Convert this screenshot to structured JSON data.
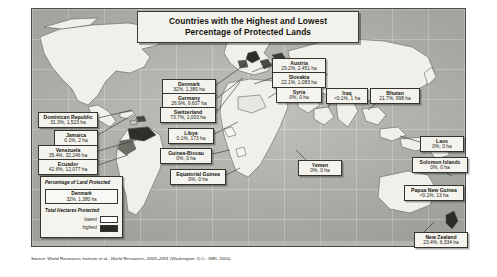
{
  "title": {
    "line1": "Countries with the Highest and Lowest",
    "line2": "Percentage of Protected Lands"
  },
  "source": {
    "prefix": "Source: World Resources Institute et al., ",
    "italic": "World Resources, 2000–2001",
    "suffix": " (Washington, D.C.: WRI, 2000)."
  },
  "legend": {
    "title": "Percentage of Land Protected",
    "sample_name": "Denmark",
    "sample_value": "32%, 1,380 ha",
    "subtitle": "Total Hectares Protected",
    "lowest_label": "lowest",
    "highest_label": "highest",
    "lowest_color": "#ffffff",
    "highest_color": "#2a2a26"
  },
  "callouts": [
    {
      "name": "Dominican Republic",
      "value": "31.3%, 1,523 ha",
      "x": 38,
      "y": 112,
      "w": 60
    },
    {
      "name": "Jamaica",
      "value": "0.1%, 2 ha",
      "x": 54,
      "y": 130,
      "w": 44
    },
    {
      "name": "Venezuela",
      "value": "35.4%, 32,246 ha",
      "x": 38,
      "y": 145,
      "w": 60
    },
    {
      "name": "Ecuador",
      "value": "42.6%, 12,077 ha",
      "x": 38,
      "y": 159,
      "w": 60
    },
    {
      "name": "Denmark",
      "value": "32%, 1,380 ha",
      "x": 162,
      "y": 79,
      "w": 54
    },
    {
      "name": "Germany",
      "value": "26.9%, 9,607 ha",
      "x": 162,
      "y": 93,
      "w": 54
    },
    {
      "name": "Switzerland",
      "value": "73.7%, 1,003 ha",
      "x": 160,
      "y": 107,
      "w": 56
    },
    {
      "name": "Libya",
      "value": "0.1%, 173 ha",
      "x": 168,
      "y": 128,
      "w": 46
    },
    {
      "name": "Guinea-Bissau",
      "value": "0%, 0 ha",
      "x": 160,
      "y": 148,
      "w": 52
    },
    {
      "name": "Equatorial Guinea",
      "value": "0%, 0 ha",
      "x": 170,
      "y": 169,
      "w": 56
    },
    {
      "name": "Austria",
      "value": "29.2%, 2,451 ha",
      "x": 272,
      "y": 58,
      "w": 54
    },
    {
      "name": "Slovakia",
      "value": "22.1%, 1,083 ha",
      "x": 272,
      "y": 72,
      "w": 54
    },
    {
      "name": "Syria",
      "value": "0%, 0 ha",
      "x": 276,
      "y": 87,
      "w": 46
    },
    {
      "name": "Iraq",
      "value": "<0.1%, 1 ha",
      "x": 326,
      "y": 88,
      "w": 42
    },
    {
      "name": "Bhutan",
      "value": "21.7%, 998 ha",
      "x": 370,
      "y": 88,
      "w": 50
    },
    {
      "name": "Yemen",
      "value": "0%, 0 ha",
      "x": 298,
      "y": 160,
      "w": 44
    },
    {
      "name": "Laos",
      "value": "0%, 0 ha",
      "x": 420,
      "y": 136,
      "w": 44
    },
    {
      "name": "Solomon Islands",
      "value": "0%, 0 ha",
      "x": 412,
      "y": 157,
      "w": 56
    },
    {
      "name": "Papua New Guinea",
      "value": "<0.1%, 13 ha",
      "x": 404,
      "y": 185,
      "w": 60
    },
    {
      "name": "New Zealand",
      "value": "23.4%, 6,334 ha",
      "x": 414,
      "y": 232,
      "w": 54
    }
  ]
}
